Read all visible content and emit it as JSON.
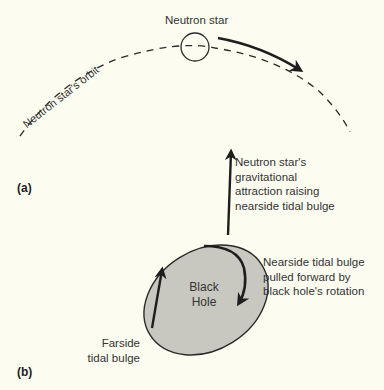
{
  "diagram": {
    "panel_a": {
      "label": "(a)",
      "neutron_star_label": "Neutron star",
      "orbit_label": "Neutron star's orbit"
    },
    "panel_b": {
      "label": "(b)",
      "black_hole_line1": "Black",
      "black_hole_line2": "Hole",
      "attraction_text": [
        "Neutron star's",
        "gravitational",
        "attraction raising",
        "nearside tidal bulge"
      ],
      "nearside_text": [
        "Nearside tidal bulge",
        "pulled forward by",
        "black hole's rotation"
      ],
      "farside_text": [
        "Farside",
        "tidal bulge"
      ]
    },
    "colors": {
      "background": "#fdfcf1",
      "black_hole_fill": "#c9c8c0",
      "stroke": "#1e1e1e"
    }
  }
}
